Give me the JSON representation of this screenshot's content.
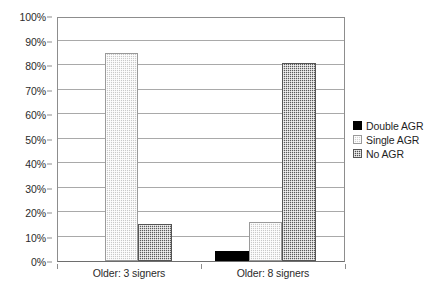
{
  "chart_data": {
    "type": "bar",
    "title": "",
    "subtitle": "",
    "xlabel": "",
    "ylabel": "",
    "categories": [
      "Older: 3 signers",
      "Older: 8 signers"
    ],
    "series": [
      {
        "name": "Double AGR",
        "values": [
          0,
          4
        ],
        "color": "#000000",
        "fill": "solid-black"
      },
      {
        "name": "Single AGR",
        "values": [
          85,
          16
        ],
        "color": "#c9c9c9",
        "fill": "light-dotted"
      },
      {
        "name": "No AGR",
        "values": [
          15,
          81
        ],
        "color": "#5a5a5a",
        "fill": "dark-checkered"
      }
    ],
    "ylim": [
      0,
      100
    ],
    "y_tick_labels": [
      "0%",
      "10%",
      "20%",
      "30%",
      "40%",
      "50%",
      "60%",
      "70%",
      "80%",
      "90%",
      "100%"
    ],
    "y_tick_values": [
      0,
      10,
      20,
      30,
      40,
      50,
      60,
      70,
      80,
      90,
      100
    ],
    "grid": true,
    "legend_position": "right"
  },
  "legend": {
    "items": [
      {
        "label": "Double AGR",
        "swatch": "double"
      },
      {
        "label": "Single AGR",
        "swatch": "single"
      },
      {
        "label": "No AGR",
        "swatch": "noagr"
      }
    ]
  }
}
